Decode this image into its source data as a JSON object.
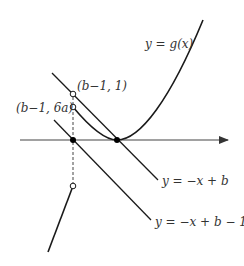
{
  "diagram": {
    "labels": {
      "curve_g": "y = g(x)",
      "point_upper": "(b−1, 1)",
      "point_lower": "(b−1, 6a)",
      "line_1": "y = −x + b",
      "line_2": "y = −x + b − 1"
    },
    "colors": {
      "stroke": "#1a1a1a",
      "axis": "#333333",
      "background": "#ffffff"
    }
  }
}
